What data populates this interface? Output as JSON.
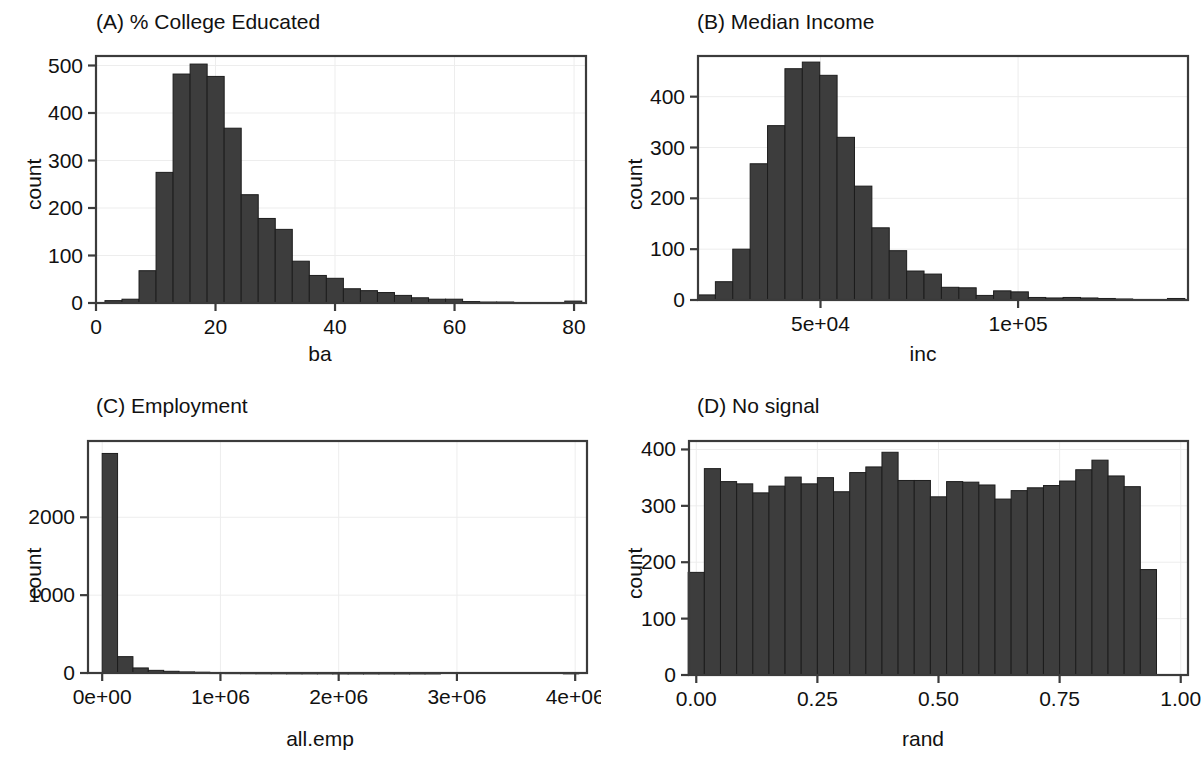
{
  "figure": {
    "width": 1203,
    "height": 769,
    "background": "#ffffff",
    "bar_fill": "#3d3d3d",
    "bar_stroke": "#1d1d1d",
    "axis_color": "#3b3b3b",
    "grid_color": "#ededed"
  },
  "chart_data": [
    {
      "id": "panel-a",
      "type": "bar",
      "title": "(A) % College Educated",
      "xlabel": "ba",
      "ylabel": "count",
      "xlim": [
        0,
        82
      ],
      "ylim": [
        0,
        520
      ],
      "xticks": [
        0,
        20,
        40,
        60,
        80
      ],
      "xticklabels": [
        "0",
        "20",
        "40",
        "60",
        "80"
      ],
      "yticks": [
        0,
        100,
        200,
        300,
        400,
        500
      ],
      "yticklabels": [
        "0",
        "100",
        "200",
        "300",
        "400",
        "500"
      ],
      "grid": true,
      "legend": "none",
      "bin_width": 2.85,
      "bin_starts": [
        1.5,
        4.35,
        7.2,
        10.05,
        12.9,
        15.75,
        18.6,
        21.45,
        24.3,
        27.15,
        30.0,
        32.85,
        35.7,
        38.55,
        41.4,
        44.25,
        47.1,
        49.95,
        52.8,
        55.65,
        58.5,
        61.35,
        64.2,
        67.05,
        69.9,
        72.75,
        75.6,
        78.45
      ],
      "values": [
        5,
        8,
        68,
        275,
        482,
        503,
        477,
        368,
        228,
        178,
        155,
        88,
        58,
        52,
        30,
        26,
        22,
        16,
        11,
        8,
        8,
        3,
        2,
        2,
        1,
        1,
        1,
        4
      ]
    },
    {
      "id": "panel-b",
      "type": "bar",
      "title": "(B) Median Income",
      "xlabel": "inc",
      "ylabel": "count",
      "xlim": [
        19000,
        143000
      ],
      "ylim": [
        0,
        480
      ],
      "xticks": [
        50000,
        100000
      ],
      "xticklabels": [
        "5e+04",
        "1e+05"
      ],
      "yticks": [
        0,
        100,
        200,
        300,
        400
      ],
      "yticklabels": [
        "0",
        "100",
        "200",
        "300",
        "400"
      ],
      "grid": true,
      "legend": "none",
      "bin_width": 4400,
      "bin_starts": [
        19000,
        23400,
        27800,
        32200,
        36600,
        41000,
        45400,
        49800,
        54200,
        58600,
        63000,
        67400,
        71800,
        76200,
        80600,
        85000,
        89400,
        93800,
        98200,
        102600,
        107000,
        111400,
        115800,
        120200,
        124600,
        129000,
        133400,
        137800
      ],
      "values": [
        10,
        36,
        100,
        268,
        343,
        455,
        468,
        442,
        320,
        224,
        142,
        97,
        57,
        51,
        25,
        24,
        9,
        18,
        16,
        5,
        4,
        5,
        4,
        3,
        2,
        1,
        1,
        3
      ]
    },
    {
      "id": "panel-c",
      "type": "bar",
      "title": "(C) Employment",
      "xlabel": "all.emp",
      "ylabel": "count",
      "xlim": [
        -120000,
        4100000
      ],
      "ylim": [
        0,
        2980
      ],
      "xticks": [
        0,
        1000000,
        2000000,
        3000000,
        4000000
      ],
      "xticklabels": [
        "0e+00",
        "1e+06",
        "2e+06",
        "3e+06",
        "4e+06"
      ],
      "yticks": [
        0,
        1000,
        2000
      ],
      "yticklabels": [
        "0",
        "1000",
        "2000"
      ],
      "grid": true,
      "legend": "none",
      "bin_width": 130000,
      "bin_starts": [
        0,
        130000,
        260000,
        390000,
        520000,
        650000,
        780000,
        910000,
        1040000,
        1170000,
        1300000,
        1430000,
        1560000,
        1690000,
        1820000,
        1950000,
        2080000,
        2210000,
        2340000,
        2470000,
        2600000,
        2730000,
        2860000,
        2990000,
        3120000,
        3250000,
        3380000,
        3510000,
        3640000,
        3770000,
        3900000
      ],
      "values": [
        2820,
        210,
        65,
        34,
        22,
        14,
        10,
        6,
        5,
        4,
        3,
        3,
        2,
        2,
        2,
        1,
        1,
        1,
        1,
        1,
        1,
        1,
        0,
        0,
        0,
        0,
        0,
        0,
        0,
        0,
        2
      ]
    },
    {
      "id": "panel-d",
      "type": "bar",
      "title": "(D) No signal",
      "xlabel": "rand",
      "ylabel": "count",
      "xlim": [
        -0.015,
        1.015
      ],
      "ylim": [
        0,
        415
      ],
      "xticks": [
        0.0,
        0.25,
        0.5,
        0.75,
        1.0
      ],
      "xticklabels": [
        "0.00",
        "0.25",
        "0.50",
        "0.75",
        "1.00"
      ],
      "yticks": [
        0,
        100,
        200,
        300,
        400
      ],
      "yticklabels": [
        "0",
        "100",
        "200",
        "300",
        "400"
      ],
      "grid": true,
      "legend": "none",
      "bin_width": 0.0333,
      "bin_starts": [
        -0.0167,
        0.0167,
        0.05,
        0.0833,
        0.1167,
        0.15,
        0.1833,
        0.2167,
        0.25,
        0.2833,
        0.3167,
        0.35,
        0.3833,
        0.4167,
        0.45,
        0.4833,
        0.5167,
        0.55,
        0.5833,
        0.6167,
        0.65,
        0.6833,
        0.7167,
        0.75,
        0.7833,
        0.8167,
        0.85,
        0.8833,
        0.9167,
        0.95,
        0.9833
      ],
      "values": [
        182,
        366,
        343,
        339,
        323,
        335,
        351,
        339,
        350,
        325,
        359,
        369,
        395,
        345,
        345,
        316,
        343,
        342,
        337,
        312,
        327,
        332,
        336,
        344,
        364,
        381,
        353,
        334,
        187,
        0,
        0
      ]
    }
  ]
}
